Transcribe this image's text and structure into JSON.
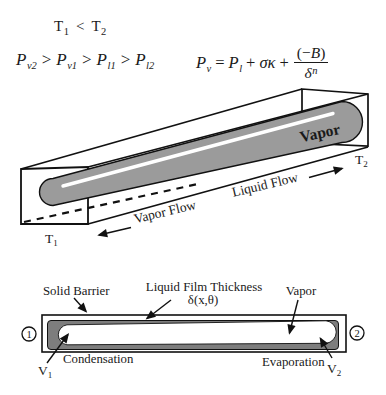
{
  "figure": {
    "equations": {
      "temperature": {
        "t": "T",
        "sub1": "1",
        "lt": "<",
        "sub2": "2"
      },
      "pressure_chain": {
        "p": "P",
        "sub1": "v2",
        "sub2": "v1",
        "sub3": "l1",
        "sub4": "l2",
        "gt": ">"
      },
      "laplace": {
        "p": "P",
        "sub_v": "v",
        "equals": "=",
        "sub_l": "l",
        "plus": "+",
        "sigma_kappa": "σκ",
        "num_open": "(−",
        "num_b": "B",
        "num_close": ")",
        "delta": "δ",
        "exponent": "n"
      }
    },
    "channel_3d": {
      "vapor_region_label": "Vapor",
      "vapor_flow_label": "Vapor Flow",
      "liquid_flow_label": "Liquid Flow",
      "t1_base": "T",
      "t1_sub": "1",
      "t2_base": "T",
      "t2_sub": "2",
      "colors": {
        "vapor_fill": "#9b9b9b",
        "line": "#111111"
      }
    },
    "cross_section": {
      "solid_barrier_label": "Solid Barrier",
      "film_thickness_label": "Liquid Film Thickness",
      "film_thickness_symbol": "δ(x,θ)",
      "vapor_label": "Vapor",
      "condensation_label": "Condensation",
      "evaporation_label": "Evaporation",
      "v1_base": "V",
      "v1_sub": "1",
      "v2_base": "V",
      "v2_sub": "2",
      "end_marker_1": "1",
      "end_marker_2": "2",
      "colors": {
        "film_fill": "#7d7d7d"
      }
    }
  }
}
